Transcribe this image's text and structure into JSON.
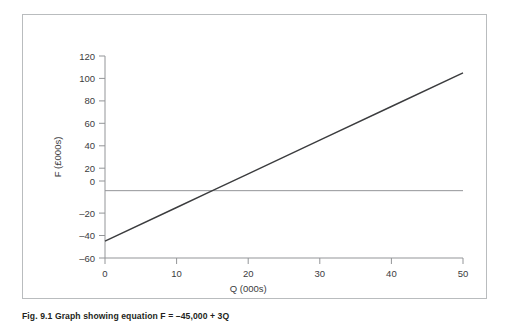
{
  "figure": {
    "caption": "Fig. 9.1 Graph showing equation F = –45,000 + 3Q",
    "frame_color": "#b9bcbe",
    "line_color": "#3b3c3e",
    "axis_color": "#939598",
    "background": "#ffffff"
  },
  "chart_data": {
    "type": "line",
    "title": "",
    "subtitle": "",
    "xlabel": "Q (000s)",
    "ylabel": "F (£000s)",
    "xlim": [
      0,
      50
    ],
    "ylim": [
      -60,
      120
    ],
    "xticks": [
      0,
      10,
      20,
      30,
      40,
      50
    ],
    "yticks": [
      120,
      100,
      80,
      60,
      40,
      20,
      0,
      -20,
      -40,
      -60
    ],
    "xtick_labels": [
      "0",
      "10",
      "20",
      "30",
      "40",
      "50"
    ],
    "ytick_labels": [
      "120",
      "100",
      "80",
      "60",
      "40",
      "20",
      "0",
      "–20",
      "–40",
      "–60"
    ],
    "grid": false,
    "legend": null,
    "legend_position": "none",
    "zero_reference_line": {
      "y": 0,
      "visible": true,
      "label": ""
    },
    "equation": "F = –45,000 + 3Q",
    "series": [
      {
        "name": "F = –45,000 + 3Q",
        "x": [
          0,
          10,
          15,
          20,
          30,
          40,
          50
        ],
        "y": [
          -45,
          -15,
          0,
          15,
          45,
          75,
          105
        ],
        "color": "#3b3c3e",
        "breakeven_q": 15
      }
    ]
  }
}
